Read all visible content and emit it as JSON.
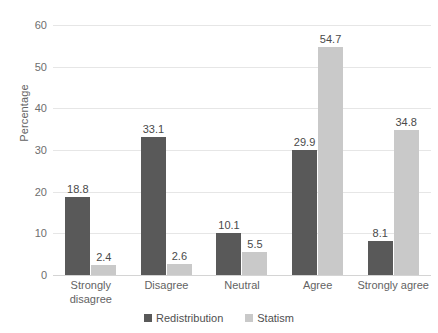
{
  "chart_data": {
    "type": "bar",
    "title": "",
    "subtitle": "",
    "xlabel": "",
    "ylabel": "Percentage",
    "categories": [
      "Strongly disagree",
      "Disagree",
      "Neutral",
      "Agree",
      "Strongly agree"
    ],
    "category_lines": [
      [
        "Strongly",
        "disagree"
      ],
      [
        "Disagree"
      ],
      [
        "Neutral"
      ],
      [
        "Agree"
      ],
      [
        "Strongly agree"
      ]
    ],
    "series": [
      {
        "name": "Redistribution",
        "color": "#595959",
        "values": [
          18.8,
          33.1,
          10.1,
          29.9,
          8.1
        ],
        "labels": [
          "18.8",
          "33.1",
          "10.1",
          "29.9",
          "8.1"
        ]
      },
      {
        "name": "Statism",
        "color": "#c9c9c9",
        "values": [
          2.4,
          2.6,
          5.5,
          54.7,
          34.8
        ],
        "labels": [
          "2.4",
          "2.6",
          "5.5",
          "54.7",
          "34.8"
        ]
      }
    ],
    "ylim": [
      0,
      60
    ],
    "yticks": [
      0,
      10,
      20,
      30,
      40,
      50,
      60
    ],
    "ytick_labels": [
      "0",
      "10",
      "20",
      "30",
      "40",
      "50",
      "60"
    ],
    "grid": "horizontal",
    "legend_position": "bottom-center",
    "data_labels": true
  }
}
